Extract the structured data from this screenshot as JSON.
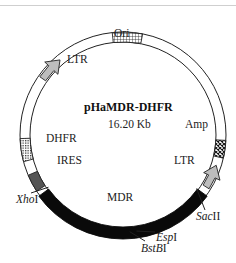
{
  "plasmid": {
    "name": "pHaMDR-DHFR",
    "size": "16.20 Kb"
  },
  "features": [
    {
      "id": "ori",
      "label": "Ori",
      "type": "grid-box"
    },
    {
      "id": "ltr-5",
      "label": "LTR",
      "type": "arrow",
      "direction": "clockwise"
    },
    {
      "id": "amp",
      "label": "Amp",
      "type": "crosshatch-box"
    },
    {
      "id": "ltr-3",
      "label": "LTR",
      "type": "arrow",
      "direction": "counterclockwise"
    },
    {
      "id": "dhfr",
      "label": "DHFR",
      "type": "dotted-box"
    },
    {
      "id": "ires",
      "label": "IRES",
      "type": "dark-gray-box"
    },
    {
      "id": "mdr",
      "label": "MDR",
      "type": "black-band"
    }
  ],
  "restriction_sites": [
    {
      "id": "xhoi",
      "italic": "Xho",
      "roman": "I"
    },
    {
      "id": "sacii",
      "italic": "Sac",
      "roman": "II"
    },
    {
      "id": "espi",
      "italic": "Esp",
      "roman": "I"
    },
    {
      "id": "bstbi",
      "italic": "BstB",
      "roman": "I"
    }
  ],
  "colors": {
    "outline": "#222222",
    "mdr": "#0a0a0a",
    "ires": "#555555",
    "ltr_arrow": "#bdbdbd",
    "background": "#ffffff"
  }
}
